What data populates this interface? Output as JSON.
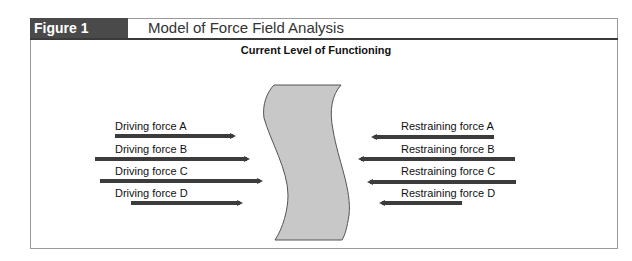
{
  "figure": {
    "label": "Figure 1",
    "title": "Model of Force Field Analysis",
    "subtitle": "Current Level of Functioning"
  },
  "driving_forces": [
    {
      "label": "Driving force A"
    },
    {
      "label": "Driving force B"
    },
    {
      "label": "Driving force C"
    },
    {
      "label": "Driving force D"
    }
  ],
  "restraining_forces": [
    {
      "label": "Restraining force A"
    },
    {
      "label": "Restraining force B"
    },
    {
      "label": "Restraining force C"
    },
    {
      "label": "Restraining force D"
    }
  ],
  "colors": {
    "arrow": "#3c3c3c",
    "banner_fill": "#c8c8c8",
    "header_dark": "#4a4a4a"
  }
}
